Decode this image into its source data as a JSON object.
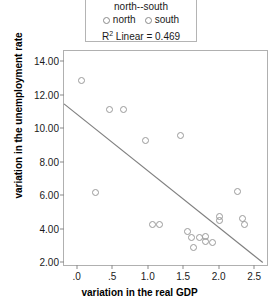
{
  "legend": {
    "title": "north--south",
    "items": [
      {
        "label": "north",
        "marker": "open-circle"
      },
      {
        "label": "south",
        "marker": "open-circle"
      }
    ],
    "r2_prefix": "R",
    "r2_sup": "2",
    "r2_text": " Linear = 0.469"
  },
  "chart_data": {
    "type": "scatter",
    "title": "",
    "xlabel": "variation in the real GDP",
    "ylabel": "variation in the unemployment rate",
    "xlim": [
      -0.18,
      2.68
    ],
    "ylim": [
      1.85,
      14.6
    ],
    "xticks": [
      0,
      0.5,
      1.0,
      1.5,
      2.0,
      2.5
    ],
    "xticklabels": [
      ".0",
      ".5",
      "1.0",
      "1.5",
      "2.0",
      "2.5"
    ],
    "yticks": [
      2,
      4,
      6,
      8,
      10,
      12,
      14
    ],
    "yticklabels": [
      "2.00",
      "4.00",
      "6.00",
      "8.00",
      "10.00",
      "12.00",
      "14.00"
    ],
    "grid": false,
    "legend_position": "top",
    "r_squared": 0.469,
    "fit_line": {
      "x": [
        -0.18,
        2.62
      ],
      "y": [
        11.45,
        2.0
      ]
    },
    "series": [
      {
        "name": "points",
        "marker": "open-circle",
        "points": [
          [
            0.05,
            12.9
          ],
          [
            0.25,
            6.2
          ],
          [
            0.45,
            11.2
          ],
          [
            0.65,
            11.2
          ],
          [
            0.95,
            9.3
          ],
          [
            1.05,
            4.35
          ],
          [
            1.15,
            4.35
          ],
          [
            1.45,
            9.6
          ],
          [
            1.55,
            3.9
          ],
          [
            1.6,
            3.55
          ],
          [
            1.63,
            2.95
          ],
          [
            1.72,
            3.55
          ],
          [
            1.8,
            3.6
          ],
          [
            1.8,
            3.3
          ],
          [
            1.9,
            3.25
          ],
          [
            2.0,
            4.8
          ],
          [
            2.0,
            4.55
          ],
          [
            2.25,
            6.3
          ],
          [
            2.32,
            4.7
          ],
          [
            2.35,
            4.35
          ]
        ]
      }
    ]
  }
}
